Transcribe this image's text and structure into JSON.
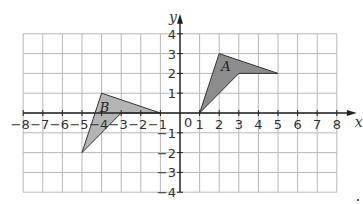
{
  "diagram": {
    "type": "coordinate-grid",
    "x_axis": {
      "label": "x",
      "min": -8,
      "max": 8,
      "ticks": [
        "-8",
        "-7",
        "-6",
        "-5",
        "-4",
        "-3",
        "-2",
        "-1",
        "1",
        "2",
        "3",
        "4",
        "5",
        "6",
        "7",
        "8"
      ]
    },
    "y_axis": {
      "label": "y",
      "min": -4,
      "max": 4,
      "ticks": [
        "4",
        "3",
        "2",
        "1",
        "-1",
        "-2",
        "-3",
        "-4"
      ]
    },
    "origin_label": "0",
    "shapes": [
      {
        "label": "A",
        "vertices": [
          [
            1,
            0
          ],
          [
            2,
            3
          ],
          [
            5,
            2
          ],
          [
            3,
            2
          ]
        ],
        "fill": "#8c8c8c",
        "label_pos": [
          2.35,
          2.35
        ]
      },
      {
        "label": "B",
        "vertices": [
          [
            -5,
            -2
          ],
          [
            -4,
            1
          ],
          [
            -1,
            0
          ],
          [
            -3,
            0
          ]
        ],
        "fill": "#b4b4b4",
        "label_pos": [
          -3.85,
          0.3
        ]
      }
    ],
    "colors": {
      "grid": "#b8b8b8",
      "axis": "#222222"
    }
  }
}
